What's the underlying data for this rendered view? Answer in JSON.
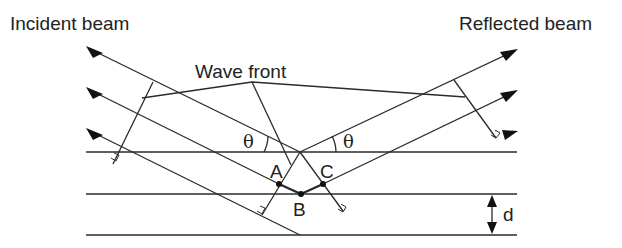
{
  "diagram": {
    "type": "Bragg diffraction schematic",
    "labels": {
      "incident": "Incident beam",
      "reflected": "Reflected beam",
      "wavefront": "Wave front",
      "theta_left": "θ",
      "theta_right": "θ",
      "point_a": "A",
      "point_b": "B",
      "point_c": "C",
      "spacing": "d"
    },
    "colors": {
      "line": "#2a2a2a",
      "text": "#222222",
      "background": "#ffffff"
    },
    "planes": [
      {
        "name": "plane-1",
        "y": 152
      },
      {
        "name": "plane-2",
        "y": 194
      },
      {
        "name": "plane-3",
        "y": 235
      }
    ],
    "incident_rays": 3,
    "reflected_rays": 3
  }
}
